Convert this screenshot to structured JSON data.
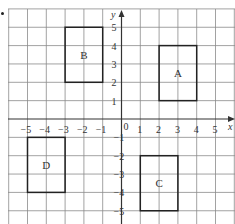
{
  "diagram": {
    "type": "coordinate-grid",
    "axes": {
      "x_label": "x",
      "y_label": "y",
      "origin_label": "0",
      "x_ticks": [
        "−5",
        "−4",
        "−3",
        "−2",
        "−1",
        "1",
        "2",
        "3",
        "4",
        "5"
      ],
      "y_ticks": [
        "5",
        "4",
        "3",
        "2",
        "1",
        "−1",
        "−2",
        "−3",
        "−4",
        "−5"
      ],
      "x_range": [
        -6,
        6
      ],
      "y_range": [
        -6,
        6
      ]
    },
    "shapes": [
      {
        "label": "A",
        "x1": 2,
        "y1": 1,
        "x2": 4,
        "y2": 4
      },
      {
        "label": "B",
        "x1": -3,
        "y1": 2,
        "x2": -1,
        "y2": 5
      },
      {
        "label": "C",
        "x1": 1,
        "y1": -5,
        "x2": 3,
        "y2": -2
      },
      {
        "label": "D",
        "x1": -5,
        "y1": -4,
        "x2": -3,
        "y2": -1
      }
    ],
    "colors": {
      "grid": "#8a8a8a",
      "axis": "#333333",
      "shape": "#222222",
      "text": "#333333"
    }
  }
}
